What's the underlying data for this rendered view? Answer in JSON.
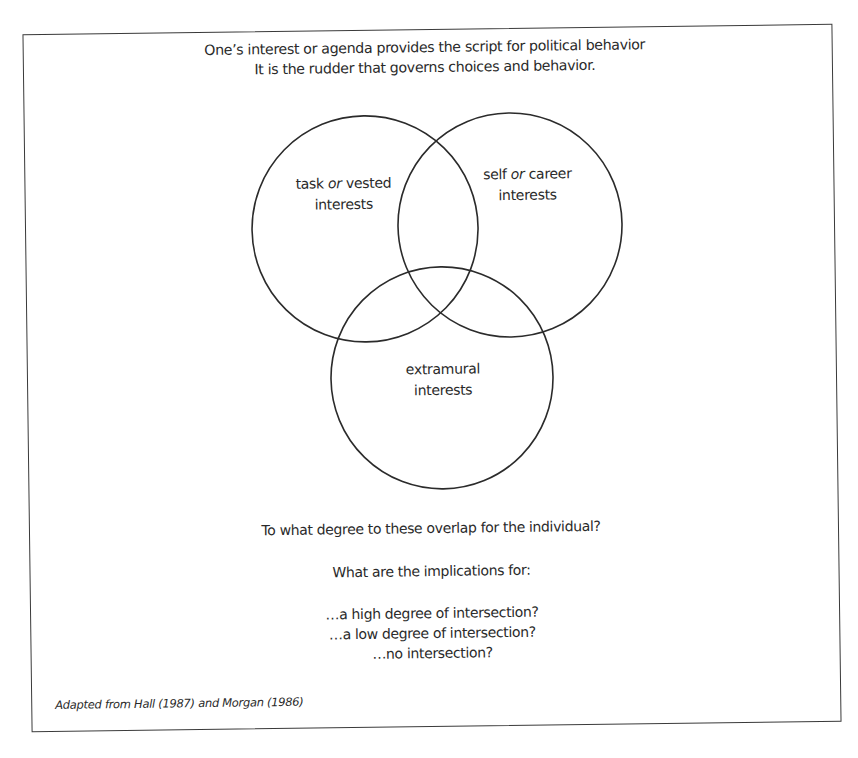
{
  "header": {
    "line1": "One’s interest or agenda provides the script for political behavior",
    "line2": "It is the rudder that governs choices and behavior."
  },
  "venn": {
    "circles": [
      {
        "id": "task",
        "label_pre": "task ",
        "label_italic": "or",
        "label_post": " vested",
        "label_line2": "interests",
        "cx": 367,
        "cy": 228,
        "r": 113
      },
      {
        "id": "self",
        "label_pre": "self ",
        "label_italic": "or",
        "label_post": " career",
        "label_line2": "interests",
        "cx": 512,
        "cy": 226,
        "r": 112
      },
      {
        "id": "extramural",
        "label_line1": "extramural",
        "label_line2": "interests",
        "cx": 442,
        "cy": 378,
        "r": 111
      }
    ],
    "stroke_color": "#2b2b2b"
  },
  "questions": {
    "main": "To what degree to these overlap for the individual?",
    "implications_intro": "What are the implications for:",
    "items": [
      "…a high degree of intersection?",
      "…a low degree of intersection?",
      "…no intersection?"
    ]
  },
  "credit": "Adapted from Hall (1987) and Morgan (1986)"
}
